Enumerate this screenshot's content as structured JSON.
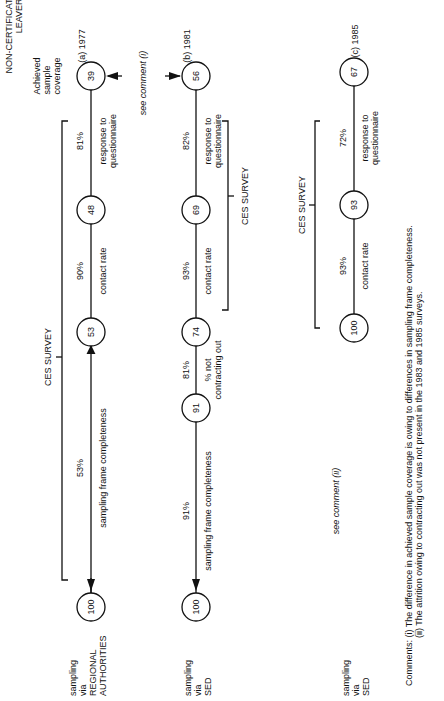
{
  "header": {
    "group_title_line1": "NON-CERTIFICATE",
    "group_title_line2": "LEAVERS",
    "coverage_label_line1": "Achieved",
    "coverage_label_line2": "sample",
    "coverage_label_line3": "coverage"
  },
  "rows": [
    {
      "id": "a",
      "year_label": "(a) 1977",
      "source_line1": "sampling",
      "source_line2": "via",
      "source_line3": "REGIONAL",
      "source_line4": "AUTHORITIES",
      "nodes": [
        "100",
        "53",
        "48",
        "39"
      ],
      "steps": [
        {
          "pct": "53%",
          "label": "sampling frame completeness"
        },
        {
          "pct": "90%",
          "label": "contact rate"
        },
        {
          "pct": "81%",
          "label_line1": "response to",
          "label_line2": "questionnaire"
        }
      ],
      "bracket_label": "CES SURVEY"
    },
    {
      "id": "b",
      "year_label": "(b) 1981",
      "source_line1": "sampling",
      "source_line2": "via",
      "source_line3": "SED",
      "nodes": [
        "100",
        "91",
        "74",
        "69",
        "56"
      ],
      "steps": [
        {
          "pct": "91%",
          "label": "sampling frame completeness"
        },
        {
          "pct": "81%",
          "label_line1": "% not",
          "label_line2": "contracting out"
        },
        {
          "pct": "93%",
          "label": "contact rate"
        },
        {
          "pct": "82%",
          "label_line1": "response to",
          "label_line2": "questionnaire"
        }
      ],
      "bracket_label": "CES SURVEY"
    },
    {
      "id": "c",
      "year_label": "(c) 1985",
      "source_line1": "sampling",
      "source_line2": "via",
      "source_line3": "SED",
      "nodes": [
        "100",
        "93",
        "67"
      ],
      "steps": [
        {
          "pct": "93%",
          "label": "contact rate"
        },
        {
          "pct": "72%",
          "label_line1": "response to",
          "label_line2": "questionnaire"
        }
      ],
      "bracket_label": "CES SURVEY",
      "note": "see comment (ii)"
    }
  ],
  "comparison_note": "see comment (i)",
  "comments": {
    "prefix": "Comments:",
    "i": "(i)  The difference in achieved sample coverage is owing to differences in sampling frame completeness.",
    "ii": "(ii)  The attrition owing to contracting out was not present in the 1983 and 1985 surveys."
  }
}
